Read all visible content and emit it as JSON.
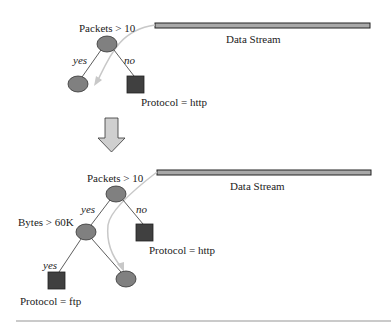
{
  "colors": {
    "node_fill": "#808080",
    "leaf_fill": "#404040",
    "stream_fill": "#a8a8a8",
    "curve": "#c0c0c0",
    "arrow_fill": "#cfcfcf",
    "divider": "#b8b8b8"
  },
  "top_tree": {
    "root_label": "Packets > 10",
    "yes_label": "yes",
    "no_label": "no",
    "leaf_label": "Protocol = http",
    "stream_label": "Data Stream"
  },
  "transition": {
    "icon": "down-arrow-icon"
  },
  "bottom_tree": {
    "root_label": "Packets > 10",
    "yes_label": "yes",
    "no_label": "no",
    "leaf_http_label": "Protocol = http",
    "inner_label": "Bytes > 60K",
    "inner_yes_label": "yes",
    "leaf_ftp_label": "Protocol = ftp",
    "stream_label": "Data Stream"
  }
}
